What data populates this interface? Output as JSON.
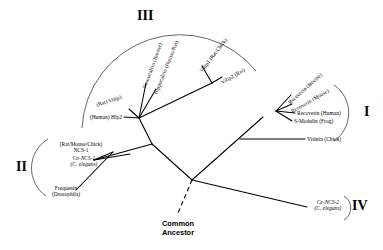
{
  "figure": {
    "type": "unrooted-phylogenetic-tree",
    "root_label_line1": "Common",
    "root_label_line2": "Ancestor"
  },
  "groups": [
    {
      "id": "I",
      "numeral": "I",
      "members": [
        "Recoverin (Bovine)",
        "Recoverin (Mouse)",
        "Recoverin (Human)",
        "S-Modulin (Frog)",
        "Visinin (Chick)"
      ]
    },
    {
      "id": "II",
      "numeral": "II",
      "members": [
        "(Rat/Mouse/Chick) NCS-1",
        "Ce-NCS-1 (C. elegans)",
        "Frequenin (Drosophila)"
      ]
    },
    {
      "id": "III",
      "numeral": "III",
      "members": [
        "(Human) Hlp2",
        "(Rat) Vilip3",
        "Neurocalcin (Bovine)",
        "Hippocalcin (Human/Rat)",
        "Vilip1 (Rat/Chick)",
        "Vilip2 (Rat)"
      ]
    },
    {
      "id": "IV",
      "numeral": "IV",
      "members": [
        "Ce-NCS-2 (C. elegans)"
      ]
    }
  ],
  "taxa": {
    "recoverin_bovine": {
      "line1": "Recoverin (Bovine)"
    },
    "recoverin_mouse": {
      "line1": "Recoverin (Mouse)"
    },
    "recoverin_human": {
      "line1": "Recoverin (Human)"
    },
    "s_modulin_frog": {
      "line1": "S-Modulin (Frog)"
    },
    "visinin_chick": {
      "line1": "Visinin (Chick)"
    },
    "ncs1_vertebrate": {
      "line1": "(Rat/Mouse/Chick)",
      "line2": "NCS-1"
    },
    "ce_ncs1": {
      "line1": "Ce-NCS-1",
      "line2": "(C. elegans)"
    },
    "frequenin": {
      "line1": "Frequenin",
      "line2": "(Drosophila)"
    },
    "hlp2_human": {
      "line1": "(Human) Hlp2"
    },
    "vilip3_rat": {
      "line1": "(Rat) Vilip3"
    },
    "neurocalcin_bovine": {
      "line1": "Neurocalcin (Bovine)"
    },
    "hippocalcin_humanrat": {
      "line1": "Hippocalcin (Human/Rat)"
    },
    "vilip1_ratchick": {
      "line1": "Vilip1 (Rat/Chick)"
    },
    "vilip2_rat": {
      "line1": "Vilip2 (Rat)"
    },
    "ce_ncs2": {
      "line1": "Ce-NCS-2",
      "line2": "(C. elegans)"
    }
  },
  "numerals": {
    "one": "I",
    "two": "II",
    "three": "III",
    "four": "IV"
  },
  "colors": {
    "line": "#000000",
    "arc": "#555555",
    "background": "#ffffff",
    "text": "#000000"
  }
}
